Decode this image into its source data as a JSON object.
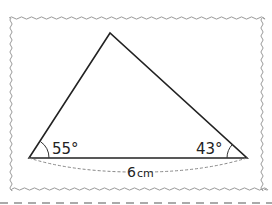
{
  "diagram": {
    "type": "triangle",
    "vertices": {
      "left": [
        29,
        158
      ],
      "right": [
        247,
        158
      ],
      "apex": [
        110,
        33
      ]
    },
    "angles": [
      {
        "vertex": "left",
        "label": "55°"
      },
      {
        "vertex": "right",
        "label": "43°"
      }
    ],
    "base_label": "6 cm",
    "base_number": "6",
    "base_unit": "cm",
    "colors": {
      "line": "#222222",
      "frame": "#999999",
      "dashed": "#888888",
      "cut_line": "#aaaaaa"
    }
  }
}
